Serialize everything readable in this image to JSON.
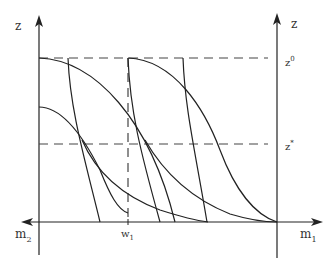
{
  "diagram": {
    "colors": {
      "line": "#222222",
      "dash": "#444444",
      "text": "#333333"
    },
    "labels": {
      "left_axis": "z",
      "right_axis": "z",
      "z0_base": "z",
      "z0_sup": "0",
      "zstar_base": "z",
      "zstar_sup": "*",
      "m1_base": "m",
      "m1_sub": "1",
      "m2_base": "m",
      "m2_sub": "2",
      "w1_base": "w",
      "w1_sub": "1"
    },
    "reference_lines": {
      "z0": "dashed horizontal at z0 level",
      "zstar": "dashed horizontal at z* level",
      "w1": "dashed vertical at w1"
    }
  }
}
